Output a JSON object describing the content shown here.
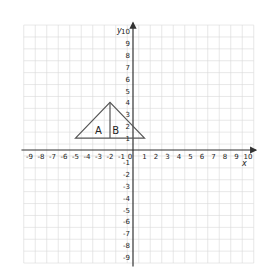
{
  "figure": {
    "type": "coordinate-grid",
    "x_axis": {
      "label": "x",
      "min": -9,
      "max": 10,
      "tick_labels": [
        "-9",
        "-8",
        "-7",
        "-6",
        "-5",
        "-4",
        "-3",
        "-2",
        "-1",
        "0",
        "1",
        "2",
        "3",
        "4",
        "5",
        "6",
        "7",
        "8",
        "9",
        "10"
      ]
    },
    "y_axis": {
      "label": "y",
      "min": -9,
      "max": 10,
      "tick_labels": [
        "10",
        "9",
        "8",
        "7",
        "6",
        "5",
        "4",
        "3",
        "2",
        "1",
        "0",
        "-1",
        "-2",
        "-3",
        "-4",
        "-5",
        "-6",
        "-7",
        "-8",
        "-9"
      ]
    },
    "triangle": {
      "vertices": [
        [
          -5,
          1
        ],
        [
          -2,
          4
        ],
        [
          1,
          1
        ]
      ],
      "divider": [
        [
          -2,
          4
        ],
        [
          -2,
          1
        ]
      ],
      "regions": [
        {
          "label": "A",
          "x": -3,
          "y": 1.7
        },
        {
          "label": "B",
          "x": -1.5,
          "y": 1.7
        }
      ]
    },
    "colors": {
      "grid": "#d9d9d9",
      "axis": "#333333",
      "shape": "#555555",
      "text": "#222222"
    }
  }
}
